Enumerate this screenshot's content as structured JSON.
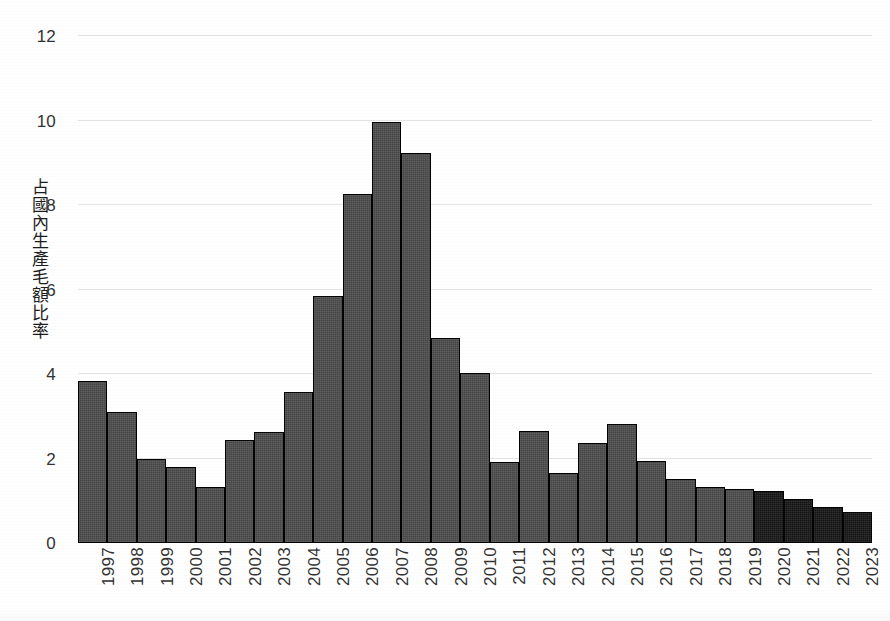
{
  "chart_data": {
    "type": "bar",
    "title": "",
    "xlabel": "",
    "ylabel": "占國內生產毛額比率",
    "ylim": [
      0,
      12
    ],
    "yticks": [
      0,
      2,
      4,
      6,
      8,
      10,
      12
    ],
    "ytick_labels": [
      "0",
      "2",
      "4",
      "6",
      "8",
      "10",
      "12"
    ],
    "grid": true,
    "legend": "none",
    "categories": [
      "1997",
      "1998",
      "1999",
      "2000",
      "2001",
      "2002",
      "2003",
      "2004",
      "2005",
      "2006",
      "2007",
      "2008",
      "2009",
      "2010",
      "2011",
      "2012",
      "2013",
      "2014",
      "2015",
      "2016",
      "2017",
      "2018",
      "2019",
      "2020",
      "2021",
      "2022",
      "2023"
    ],
    "values": [
      3.83,
      3.1,
      1.99,
      1.8,
      1.33,
      2.44,
      2.63,
      3.57,
      5.85,
      8.26,
      9.97,
      9.23,
      4.85,
      4.02,
      1.92,
      2.65,
      1.66,
      2.37,
      2.82,
      1.94,
      1.51,
      1.33,
      1.28,
      1.23,
      1.04,
      0.85,
      0.73
    ],
    "series": [
      {
        "name": "占國內生產毛額比率",
        "values": [
          3.83,
          3.1,
          1.99,
          1.8,
          1.33,
          2.44,
          2.63,
          3.57,
          5.85,
          8.26,
          9.97,
          9.23,
          4.85,
          4.02,
          1.92,
          2.65,
          1.66,
          2.37,
          2.82,
          1.94,
          1.51,
          1.33,
          1.28,
          1.23,
          1.04,
          0.85,
          0.73
        ]
      }
    ],
    "bar_styles": [
      "actual",
      "actual",
      "actual",
      "actual",
      "actual",
      "actual",
      "actual",
      "actual",
      "actual",
      "actual",
      "actual",
      "actual",
      "actual",
      "actual",
      "actual",
      "actual",
      "actual",
      "actual",
      "actual",
      "actual",
      "actual",
      "actual",
      "actual",
      "forecast",
      "forecast",
      "forecast",
      "forecast"
    ],
    "colors": {
      "bar_actual": "#4c4c4c",
      "bar_forecast": "#161616",
      "bar_outline": "#000000",
      "gridline": "#e3e3e3",
      "axis": "#6d6d6d",
      "text": "#333333",
      "background": "#ffffff"
    }
  }
}
